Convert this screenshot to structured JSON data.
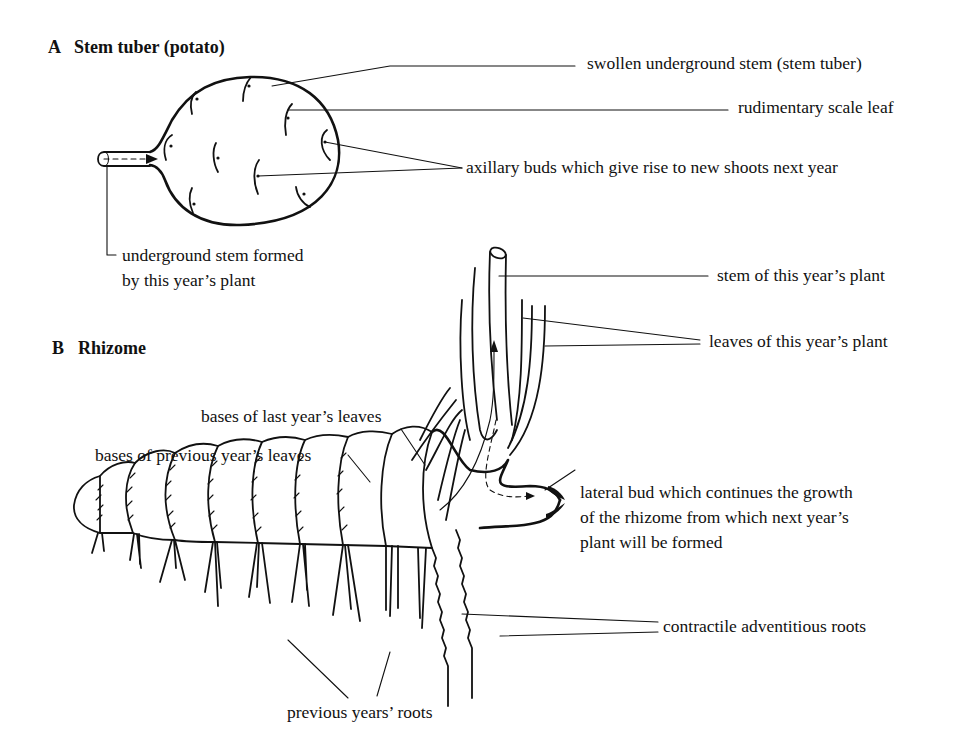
{
  "figure": {
    "part_a": {
      "letter": "A",
      "title": "Stem tuber (potato)",
      "labels": {
        "swollen_stem": "swollen underground stem (stem tuber)",
        "scale_leaf": "rudimentary scale leaf",
        "axillary_buds": "axillary buds which give rise to new shoots next year",
        "underground_stem_line1": "underground stem formed",
        "underground_stem_line2": "by this year’s plant"
      }
    },
    "part_b": {
      "letter": "B",
      "title": "Rhizome",
      "labels": {
        "stem_this_year": "stem of this year’s plant",
        "leaves_this_year": "leaves of this year’s plant",
        "bases_last_year": "bases of last year’s leaves",
        "bases_previous_year": "bases of previous year’s leaves",
        "lateral_bud_line1": "lateral bud which continues the growth",
        "lateral_bud_line2": "of the rhizome from which next year’s",
        "lateral_bud_line3": "plant will be formed",
        "contractile_roots": "contractile adventitious roots",
        "previous_roots": "previous years’ roots"
      }
    },
    "colors": {
      "ink": "#111111",
      "background": "#ffffff"
    }
  }
}
